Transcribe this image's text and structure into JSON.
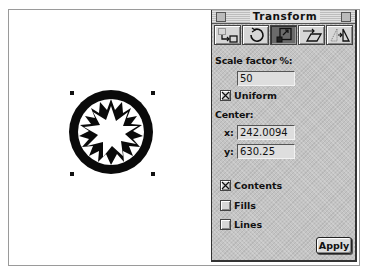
{
  "panel": {
    "title": "Transform",
    "tools": [
      {
        "name": "move",
        "icon": "move-icon",
        "active": false
      },
      {
        "name": "rotate",
        "icon": "rotate-icon",
        "active": false
      },
      {
        "name": "scale",
        "icon": "scale-icon",
        "active": true
      },
      {
        "name": "skew",
        "icon": "skew-icon",
        "active": false
      },
      {
        "name": "reflect",
        "icon": "reflect-icon",
        "active": false
      }
    ],
    "scale_factor_label": "Scale factor %:",
    "scale_factor_value": "50",
    "uniform_label": "Uniform",
    "uniform_checked": true,
    "center_label": "Center:",
    "x_label": "x:",
    "x_value": "242.0094",
    "y_label": "y:",
    "y_value": "630.25",
    "contents_label": "Contents",
    "contents_checked": true,
    "fills_label": "Fills",
    "fills_checked": false,
    "lines_label": "Lines",
    "lines_checked": false,
    "apply_label": "Apply"
  },
  "canvas": {
    "selected_object": "circle-with-starburst",
    "selection_handles": 4
  }
}
